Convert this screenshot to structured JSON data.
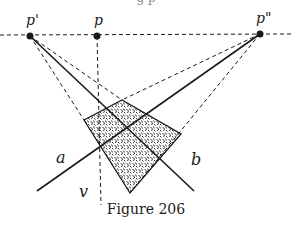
{
  "figure": {
    "caption": "Figure 206",
    "top_cut_text": "g         p",
    "labels": {
      "p_prime": "p'",
      "p": "p",
      "p_double_prime": "p\"",
      "line_a": "a",
      "line_b": "b",
      "line_v": "v"
    },
    "points": {
      "p_prime": [
        30,
        36
      ],
      "p": [
        97,
        36
      ],
      "p_double_prime": [
        260,
        34
      ]
    },
    "quad": [
      [
        84,
        120
      ],
      [
        122,
        100
      ],
      [
        181,
        134
      ],
      [
        130,
        193
      ]
    ],
    "colors": {
      "ink": "#1a1a1a",
      "background": "#ffffff"
    }
  }
}
